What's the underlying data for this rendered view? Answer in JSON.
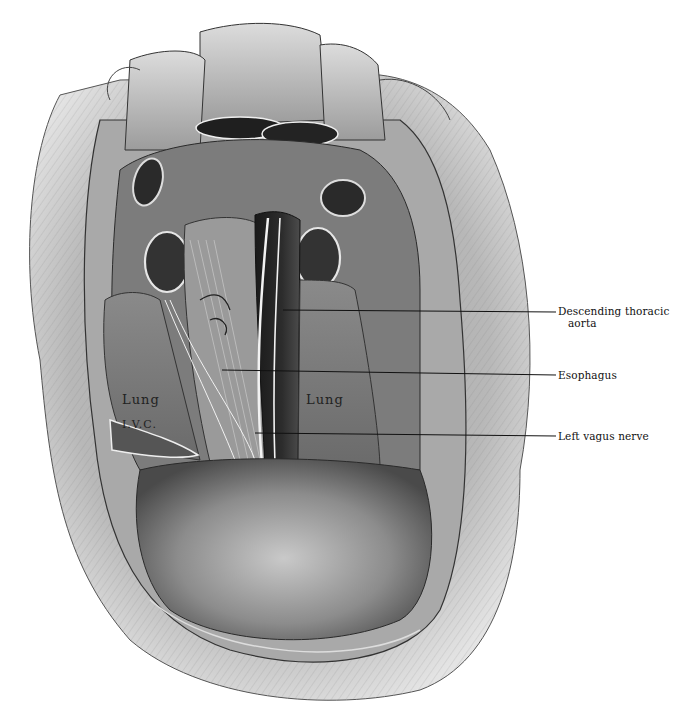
{
  "figure": {
    "palette": {
      "ink": "#111111",
      "paper": "#ffffff",
      "dark_tissue": "#2e2e2e",
      "mid_tissue": "#8a8a8a",
      "light_tissue": "#c8c8c8"
    }
  },
  "callouts": [
    {
      "id": "descending-thoracic-aorta",
      "line1": "Descending thoracic",
      "line2": "aorta",
      "x1": 283,
      "y1": 310,
      "x2": 556,
      "y2": 312
    },
    {
      "id": "esophagus",
      "line1": "Esophagus",
      "line2": "",
      "x1": 222,
      "y1": 370,
      "x2": 556,
      "y2": 375
    },
    {
      "id": "left-vagus-nerve",
      "line1": "Left vagus nerve",
      "line2": "",
      "x1": 255,
      "y1": 433,
      "x2": 556,
      "y2": 436
    }
  ],
  "inline_labels": {
    "lung_left": "Lung",
    "lung_right": "Lung",
    "ivc": "I.V.C."
  }
}
